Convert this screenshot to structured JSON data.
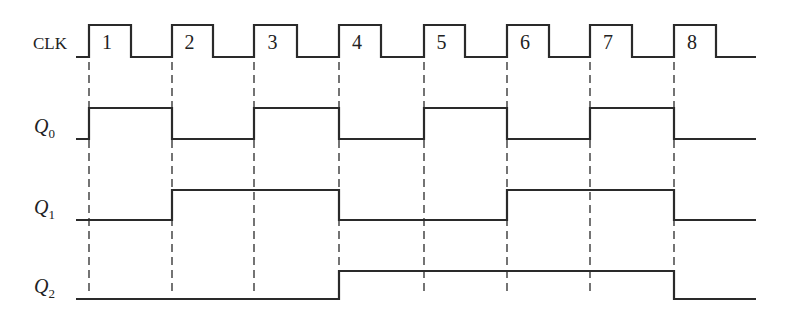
{
  "diagram": {
    "type": "timing-diagram",
    "x_start": 76,
    "x_end": 756,
    "clock_edges": [
      89,
      172,
      254,
      339,
      424,
      507,
      590,
      674
    ],
    "clock_fall_edges": [
      131,
      213,
      297,
      381,
      465,
      549,
      632,
      716
    ],
    "dash_top": 62,
    "dash_bottom": 296,
    "signals": [
      {
        "id": "clk",
        "label": "CLK",
        "subscript": "",
        "y_high": 25,
        "y_low": 57,
        "label_y": 49,
        "pulse_labels": [
          "1",
          "2",
          "3",
          "4",
          "5",
          "6",
          "7",
          "8"
        ]
      },
      {
        "id": "q0",
        "label": "Q",
        "subscript": "0",
        "y_high": 108,
        "y_low": 139,
        "label_y": 133,
        "levels": [
          0,
          1,
          0,
          1,
          0,
          1,
          0,
          1,
          0
        ]
      },
      {
        "id": "q1",
        "label": "Q",
        "subscript": "1",
        "y_high": 190,
        "y_low": 220,
        "label_y": 214,
        "levels": [
          0,
          0,
          1,
          1,
          0,
          0,
          1,
          1,
          0
        ]
      },
      {
        "id": "q2",
        "label": "Q",
        "subscript": "2",
        "y_high": 271,
        "y_low": 299,
        "label_y": 293,
        "levels": [
          0,
          0,
          0,
          0,
          1,
          1,
          1,
          1,
          0
        ]
      }
    ]
  }
}
